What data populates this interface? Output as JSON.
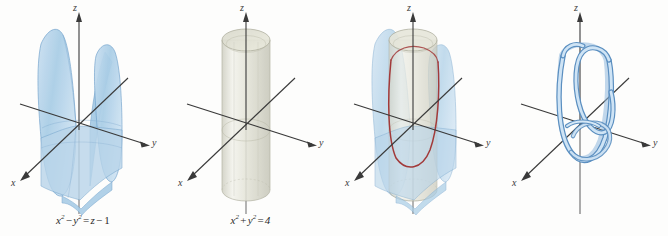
{
  "figure": {
    "background_color": "#fdfdfc",
    "width": 668,
    "height": 236,
    "panel_count": 4
  },
  "colors": {
    "axis": "#3a3a3a",
    "surface_blue_fill": "#b9d5ea",
    "surface_blue_edge": "#6d9fca",
    "surface_blue_light": "#d6e7f4",
    "cylinder_fill": "#ddddd0",
    "cylinder_edge": "#a9a998",
    "cylinder_highlight": "#f2f2ea",
    "intersection_red": "#a23a3a",
    "tube_fill": "#bcd9ef",
    "tube_edge": "#5b8fc0",
    "label_text": "#2a2a2a"
  },
  "axes": {
    "x_label": "x",
    "y_label": "y",
    "z_label": "z"
  },
  "panels": [
    {
      "id": "panel-hyperbolic-paraboloid",
      "name": "hyperbolic-paraboloid-surface",
      "equation": {
        "lhs_term1_base": "x",
        "lhs_term1_exp": "2",
        "lhs_operator": "−",
        "lhs_term2_base": "y",
        "lhs_term2_exp": "2",
        "equals": "=",
        "rhs_term1": "z",
        "rhs_operator": "−",
        "rhs_term2": "1",
        "plain": "x2 - y2 = z - 1"
      },
      "has_blue_surface": true,
      "has_cylinder": false,
      "has_red_curve": false,
      "has_blue_tube": false,
      "axis_labels": {
        "x": "x",
        "y": "y",
        "z": "z"
      }
    },
    {
      "id": "panel-circular-cylinder",
      "name": "circular-cylinder-surface",
      "equation": {
        "lhs_term1_base": "x",
        "lhs_term1_exp": "2",
        "lhs_operator": "+",
        "lhs_term2_base": "y",
        "lhs_term2_exp": "2",
        "equals": "=",
        "rhs_term1": "4",
        "rhs_operator": "",
        "rhs_term2": "",
        "plain": "x2 + y2 = 4"
      },
      "has_blue_surface": false,
      "has_cylinder": true,
      "has_red_curve": false,
      "has_blue_tube": false,
      "axis_labels": {
        "x": "x",
        "y": "y",
        "z": "z"
      }
    },
    {
      "id": "panel-intersection",
      "name": "surfaces-intersection",
      "equation": null,
      "has_blue_surface": true,
      "has_cylinder": true,
      "has_red_curve": true,
      "has_blue_tube": false,
      "axis_labels": {
        "x": "x",
        "y": "y",
        "z": "z"
      }
    },
    {
      "id": "panel-space-curve",
      "name": "space-curve-tube",
      "equation": null,
      "has_blue_surface": false,
      "has_cylinder": false,
      "has_red_curve": false,
      "has_blue_tube": true,
      "axis_labels": {
        "x": "x",
        "y": "y",
        "z": "z"
      }
    }
  ]
}
